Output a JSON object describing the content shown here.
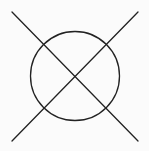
{
  "symbol": {
    "name": "circle-with-x",
    "background": "#fbfbfb",
    "stroke_color": "#222222",
    "stroke_width": 1.3,
    "circle": {
      "cx": 75,
      "cy": 76,
      "r": 44.5
    },
    "lines": [
      {
        "x1": 12,
        "y1": 12,
        "x2": 138,
        "y2": 141
      },
      {
        "x1": 138,
        "y1": 12,
        "x2": 12,
        "y2": 141
      }
    ]
  }
}
